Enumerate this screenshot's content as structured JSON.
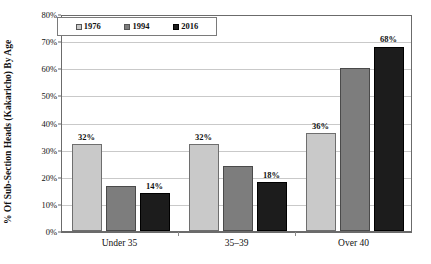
{
  "chart_data": {
    "type": "bar",
    "title": "",
    "subtitle": "",
    "xlabel": "",
    "ylabel": "% Of Sub-Section Heads (Kakaricho) By Age",
    "categories": [
      "Under 35",
      "35–39",
      "Over 40"
    ],
    "series": [
      {
        "name": "1976",
        "color": "#c9c9c9",
        "values": [
          32,
          32,
          36
        ],
        "labels": [
          "32%",
          "32%",
          "36%"
        ]
      },
      {
        "name": "1994",
        "color": "#7d7d7d",
        "values": [
          16.5,
          23.8,
          60.2
        ],
        "labels": [
          "",
          "",
          ""
        ]
      },
      {
        "name": "2016",
        "color": "#1c1c1c",
        "values": [
          14,
          18,
          68
        ],
        "labels": [
          "14%",
          "18%",
          "68%"
        ]
      }
    ],
    "ylim": [
      0,
      80
    ],
    "ytick_step": 10,
    "ytick_labels": [
      "0%",
      "10%",
      "20%",
      "30%",
      "40%",
      "50%",
      "60%",
      "70%",
      "80%"
    ],
    "ytick_values": [
      0,
      10,
      20,
      30,
      40,
      50,
      60,
      70,
      80
    ],
    "grid": true,
    "grid_axis": "y",
    "legend_position": "top-left",
    "value_label_format": "percent"
  },
  "legend": {
    "items": [
      {
        "label": "1976",
        "color": "#c9c9c9"
      },
      {
        "label": "1994",
        "color": "#7d7d7d"
      },
      {
        "label": "2016",
        "color": "#1c1c1c"
      }
    ]
  },
  "axes": {
    "y_title": "% Of Sub-Section Heads (Kakaricho) By Age"
  }
}
